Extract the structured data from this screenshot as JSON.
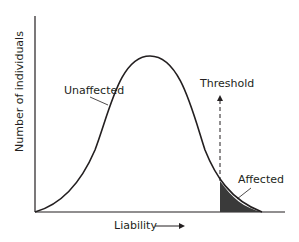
{
  "diagram": {
    "y_axis_label": "Number of individuals",
    "x_axis_label": "Liability",
    "curve_label": "Unaffected",
    "threshold_label": "Threshold",
    "tail_label": "Affected",
    "colors": {
      "line": "#231f20",
      "shade": "#3a3a3a",
      "background": "#ffffff"
    }
  }
}
